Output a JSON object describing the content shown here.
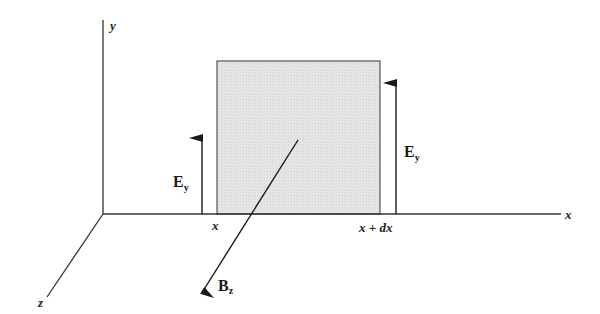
{
  "diagram": {
    "axes": {
      "y_label": "y",
      "x_label": "x",
      "z_label": "z"
    },
    "element": {
      "left_edge_label": "x",
      "right_edge_label": "x + dx",
      "fill_color": "#e2e2e2",
      "stroke_color": "#555555"
    },
    "vectors": {
      "e_left": {
        "symbol": "E",
        "subscript": "y"
      },
      "e_right": {
        "symbol": "E",
        "subscript": "y"
      },
      "b": {
        "symbol": "B",
        "subscript": "z"
      }
    }
  }
}
